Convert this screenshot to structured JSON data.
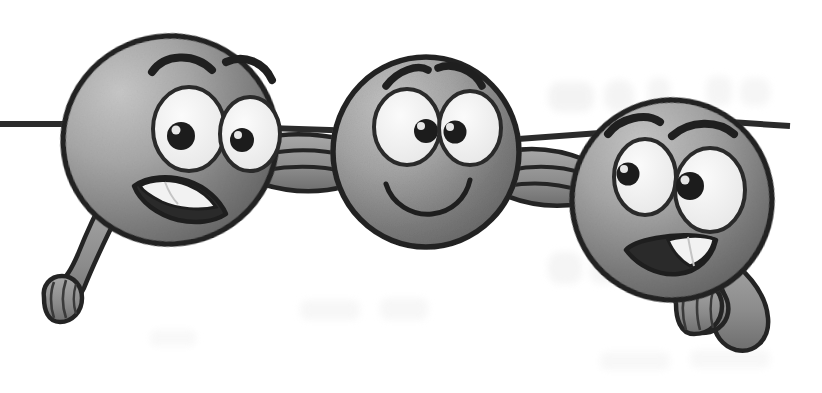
{
  "image": {
    "title": "Three linked cartoon ball characters",
    "medium": "grayscale line drawing, scanned page",
    "background_color": "#ffffff",
    "width": 822,
    "height": 393
  },
  "palette": {
    "outline": "#242424",
    "ball_light": "#c0c0c0",
    "ball_mid": "#9a9a9a",
    "ball_dark": "#686868",
    "ball_edge_dark": "#565656",
    "eye_white": "#f2f2f2",
    "eye_outline": "#2a2a2a",
    "pupil": "#1e1e1e",
    "pupil_highlight": "#e8e8e8",
    "tooth_white": "#f4f4f4",
    "mouth_dark": "#262626",
    "arm_fill": "#8e8e8e",
    "line_color": "#2b2b2b",
    "ghost_text": "#ededed"
  },
  "scene": {
    "horizontal_line": {
      "name": "horizontal rule passing behind the characters",
      "y": 124,
      "x_start": 0,
      "x_end": 790,
      "thickness": 5,
      "color": "#2b2b2b"
    },
    "ghost_marks": [
      {
        "label": "faint bleed-through blob upper right",
        "x": 548,
        "y": 82,
        "w": 120,
        "h": 34
      },
      {
        "label": "faint bleed-through blob far right",
        "x": 700,
        "y": 78,
        "w": 70,
        "h": 30
      },
      {
        "label": "faint bleed-through blob lower left",
        "x": 548,
        "y": 252,
        "w": 90,
        "h": 34
      },
      {
        "label": "faint bleed-through smudge center",
        "x": 300,
        "y": 300,
        "w": 150,
        "h": 26
      },
      {
        "label": "faint bleed-through smudge bottom right",
        "x": 600,
        "y": 352,
        "w": 170,
        "h": 22
      }
    ],
    "characters": [
      {
        "id": "left",
        "name": "left ball character",
        "center_x": 170,
        "center_y": 140,
        "radius_x": 107,
        "radius_y": 104,
        "rotation_deg": -8,
        "expression": "grinning with visible teeth",
        "eyebrows": "both raised and angled outward",
        "mouth": "wide open grin showing upper teeth",
        "limb": {
          "type": "arm hanging down-left ending in a closed fist",
          "direction": "down-left",
          "fist_x": 72,
          "fist_y": 303
        },
        "eyes": [
          {
            "cx": 189,
            "cy": 129,
            "rx": 36,
            "ry": 42,
            "pupil_cx": 181,
            "pupil_cy": 135,
            "pupil_r": 13
          },
          {
            "cx": 250,
            "cy": 134,
            "rx": 30,
            "ry": 37,
            "pupil_cx": 242,
            "pupil_cy": 139,
            "pupil_r": 11
          }
        ]
      },
      {
        "id": "middle",
        "name": "middle ball character",
        "center_x": 426,
        "center_y": 152,
        "radius_x": 93,
        "radius_y": 95,
        "rotation_deg": 0,
        "expression": "calm closed-mouth smile",
        "eyebrows": "both arched, inner ends raised",
        "mouth": "simple upturned closed smile",
        "limb": {
          "type": "none, both arms link to neighbours"
        },
        "eyes": [
          {
            "cx": 407,
            "cy": 127,
            "rx": 33,
            "ry": 38,
            "pupil_cx": 425,
            "pupil_cy": 130,
            "pupil_r": 11
          },
          {
            "cx": 470,
            "cy": 128,
            "rx": 31,
            "ry": 37,
            "pupil_cx": 455,
            "pupil_cy": 131,
            "pupil_r": 11
          }
        ]
      },
      {
        "id": "right",
        "name": "right ball character",
        "center_x": 672,
        "center_y": 200,
        "radius_x": 100,
        "radius_y": 100,
        "rotation_deg": 10,
        "expression": "sly half grin with teeth",
        "eyebrows": "left low and angled, right raised high",
        "mouth": "lopsided grin showing teeth on the right",
        "limb": {
          "type": "bent arm with fist tucked under the chin",
          "direction": "down-left across body",
          "fist_x": 722,
          "fist_y": 322
        },
        "eyes": [
          {
            "cx": 645,
            "cy": 177,
            "rx": 31,
            "ry": 38,
            "pupil_cx": 628,
            "pupil_cy": 173,
            "pupil_r": 11
          },
          {
            "cx": 710,
            "cy": 190,
            "rx": 35,
            "ry": 42,
            "pupil_cx": 690,
            "pupil_cy": 185,
            "pupil_r": 13
          }
        ]
      }
    ],
    "linking_arms": [
      {
        "id": "left-to-middle",
        "name": "arm linking left character to middle character",
        "from": "left",
        "to": "middle",
        "x_start": 272,
        "x_end": 340,
        "y": 160,
        "stripes": 3
      },
      {
        "id": "middle-to-right",
        "name": "arm linking middle character to right character",
        "from": "middle",
        "to": "right",
        "x_start": 514,
        "x_end": 580,
        "y": 182,
        "stripes": 3
      }
    ]
  }
}
